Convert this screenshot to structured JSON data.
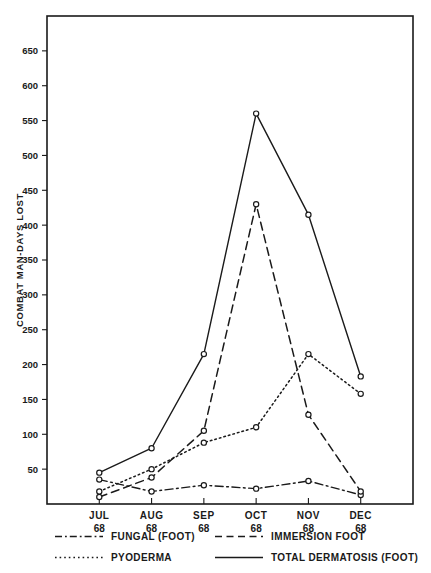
{
  "chart_data": {
    "type": "line",
    "title": "",
    "xlabel": "",
    "ylabel": "COMBAT MAN-DAYS LOST",
    "categories": [
      "JUL",
      "AUG",
      "SEP",
      "OCT",
      "NOV",
      "DEC"
    ],
    "category_years": [
      "68",
      "68",
      "68",
      "68",
      "68",
      "68"
    ],
    "ylim": [
      0,
      700
    ],
    "xlim": [
      0,
      7
    ],
    "grid": false,
    "legend_position": "below-axes",
    "ytick_labels": [
      "50",
      "100",
      "150",
      "200",
      "250",
      "300",
      "350",
      "400",
      "450",
      "500",
      "550",
      "600",
      "650"
    ],
    "ytick_values": [
      50,
      100,
      150,
      200,
      250,
      300,
      350,
      400,
      450,
      500,
      550,
      600,
      650
    ],
    "series": [
      {
        "name": "FUNGAL  (FOOT)",
        "style": "dashdot",
        "marker": "open-circle",
        "values": [
          35,
          18,
          27,
          22,
          33,
          13
        ]
      },
      {
        "name": "IMMERSION  FOOT",
        "style": "dashed",
        "marker": "open-circle",
        "values": [
          10,
          38,
          105,
          430,
          128,
          18
        ]
      },
      {
        "name": "PYODERMA",
        "style": "dotted",
        "marker": "open-circle",
        "values": [
          18,
          50,
          88,
          110,
          215,
          158
        ]
      },
      {
        "name": "TOTAL  DERMATOSIS  (FOOT)",
        "style": "solid",
        "marker": "open-circle",
        "values": [
          45,
          80,
          215,
          560,
          415,
          183
        ]
      }
    ],
    "colors": {
      "ink": "#1a1a1a",
      "background": "#ffffff"
    }
  },
  "legend": {
    "entries": [
      {
        "label": "FUNGAL  (FOOT)",
        "style": "dashdot"
      },
      {
        "label": "IMMERSION  FOOT",
        "style": "dashed"
      },
      {
        "label": "PYODERMA",
        "style": "dotted"
      },
      {
        "label": "TOTAL  DERMATOSIS  (FOOT)",
        "style": "solid"
      }
    ]
  }
}
